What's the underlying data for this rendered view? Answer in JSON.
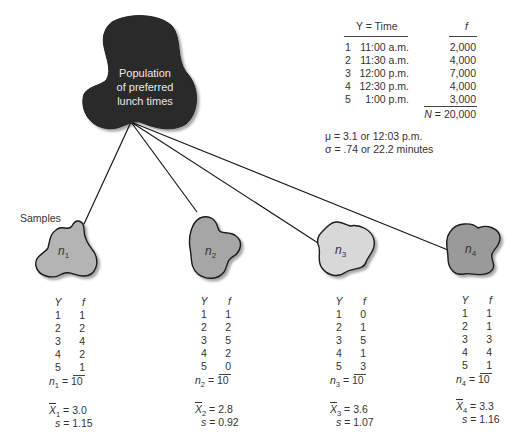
{
  "population": {
    "label_lines": [
      "Population",
      "of preferred",
      "lunch times"
    ],
    "fill_color": "#2b2b2b",
    "table": {
      "headers": {
        "y": "Y = Time",
        "f": "f"
      },
      "rows": [
        {
          "idx": "1",
          "time": "11:00 a.m.",
          "f": "2,000"
        },
        {
          "idx": "2",
          "time": "11:30 a.m.",
          "f": "4,000"
        },
        {
          "idx": "3",
          "time": "12:00 p.m.",
          "f": "7,000"
        },
        {
          "idx": "4",
          "time": "12:30 p.m.",
          "f": "4,000"
        },
        {
          "idx": "5",
          "time": "1:00 p.m.",
          "f": "3,000"
        }
      ],
      "total_symbol": "N",
      "total_value": "= 20,000"
    },
    "stats": {
      "mu": "μ = 3.1 or 12:03 p.m.",
      "sigma": "σ = .74 or 22.2 minutes"
    }
  },
  "samples_label": "Samples",
  "samples": [
    {
      "name": "n",
      "sub": "1",
      "fill_color": "#b4b4b4",
      "header": {
        "y": "Y",
        "f": "f"
      },
      "rows": [
        {
          "y": "1",
          "f": "1"
        },
        {
          "y": "2",
          "f": "2"
        },
        {
          "y": "3",
          "f": "4"
        },
        {
          "y": "4",
          "f": "2"
        },
        {
          "y": "5",
          "f": "1"
        }
      ],
      "n_total": "= 10",
      "n_value": "10",
      "mean_symbol": "X",
      "mean_value": "= 3.0",
      "sd_symbol": "s",
      "sd_value": "= 1.15"
    },
    {
      "name": "n",
      "sub": "2",
      "fill_color": "#a6a6a6",
      "header": {
        "y": "Y",
        "f": "f"
      },
      "rows": [
        {
          "y": "1",
          "f": "1"
        },
        {
          "y": "2",
          "f": "2"
        },
        {
          "y": "3",
          "f": "5"
        },
        {
          "y": "4",
          "f": "2"
        },
        {
          "y": "5",
          "f": "0"
        }
      ],
      "n_total": "= 10",
      "n_value": "10",
      "mean_symbol": "X",
      "mean_value": "= 2.8",
      "sd_symbol": "s",
      "sd_value": "= 0.92"
    },
    {
      "name": "n",
      "sub": "3",
      "fill_color": "#d8d8d8",
      "header": {
        "y": "Y",
        "f": "f"
      },
      "rows": [
        {
          "y": "1",
          "f": "0"
        },
        {
          "y": "2",
          "f": "1"
        },
        {
          "y": "3",
          "f": "5"
        },
        {
          "y": "4",
          "f": "1"
        },
        {
          "y": "5",
          "f": "3"
        }
      ],
      "n_total": "= 10",
      "n_value": "10",
      "mean_symbol": "X",
      "mean_value": "= 3.6",
      "sd_symbol": "s",
      "sd_value": "= 1.07"
    },
    {
      "name": "n",
      "sub": "4",
      "fill_color": "#9a9a9a",
      "header": {
        "y": "Y",
        "f": "f"
      },
      "rows": [
        {
          "y": "1",
          "f": "1"
        },
        {
          "y": "2",
          "f": "1"
        },
        {
          "y": "3",
          "f": "3"
        },
        {
          "y": "4",
          "f": "4"
        },
        {
          "y": "5",
          "f": "1"
        }
      ],
      "n_total": "= 10",
      "n_value": "10",
      "mean_symbol": "X",
      "mean_value": "= 3.3",
      "sd_symbol": "s",
      "sd_value": "= 1.16"
    }
  ]
}
